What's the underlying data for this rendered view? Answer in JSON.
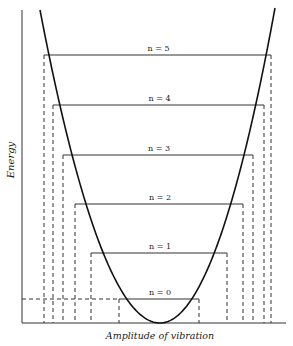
{
  "diagram": {
    "type": "potential-energy-well",
    "axes": {
      "y_label": "Energy",
      "x_label": "Amplitude of vibration"
    },
    "levels": [
      {
        "label": "n = 5",
        "y": 55,
        "x1": 44,
        "x2": 271
      },
      {
        "label": "n = 4",
        "y": 105,
        "x1": 53,
        "x2": 264
      },
      {
        "label": "n = 3",
        "y": 155,
        "x1": 63,
        "x2": 253
      },
      {
        "label": "n = 2",
        "y": 204,
        "x1": 75,
        "x2": 243
      },
      {
        "label": "n = 1",
        "y": 253,
        "x1": 91,
        "x2": 227
      },
      {
        "label": "n = 0",
        "y": 299,
        "x1": 119,
        "x2": 199
      }
    ],
    "colors": {
      "line": "#1a1a1a",
      "background": "#ffffff"
    }
  }
}
